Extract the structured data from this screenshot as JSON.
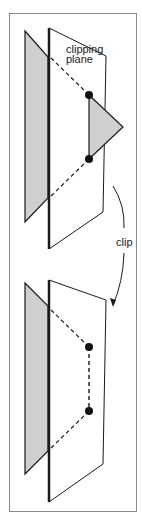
{
  "figure": {
    "labels": {
      "clipping_plane_line1": "clipping",
      "clipping_plane_line2": "plane",
      "clip": "clip"
    },
    "colors": {
      "frame": "#8a8a8a",
      "line": "#1a1a1a",
      "polygon_fill": "#cfcfcf",
      "vertex": "#111111",
      "background": "#ffffff"
    },
    "panels": [
      {
        "name": "before-clip",
        "description": "Triangle crossing a clipping plane; portion beyond plane shaded"
      },
      {
        "name": "after-clip",
        "description": "Triangle clipped at plane; new vertices on plane connected"
      }
    ]
  }
}
